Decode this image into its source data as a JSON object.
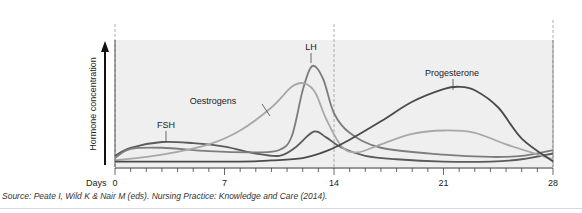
{
  "chart_data": {
    "type": "line",
    "title": "",
    "xlabel": "Days",
    "ylabel": "Hormone concentration",
    "xlim": [
      0,
      28
    ],
    "ylim": [
      0,
      10
    ],
    "x_ticks": [
      0,
      7,
      14,
      21,
      28
    ],
    "minor_tick_step": 1,
    "grid": false,
    "reference_lines": [
      {
        "x": 0,
        "style": "dashed"
      },
      {
        "x": 14,
        "style": "dashed"
      },
      {
        "x": 28,
        "style": "dashed"
      }
    ],
    "background": "#efefef",
    "series": [
      {
        "name": "FSH",
        "color": "#5a5a5a",
        "label_pos": {
          "day": 3.3,
          "value": 4.1
        },
        "x": [
          0,
          1,
          3,
          5,
          7,
          9,
          10.5,
          11.5,
          12.7,
          13.5,
          14.5,
          16,
          18,
          21,
          24,
          26,
          28
        ],
        "values": [
          0.8,
          1.5,
          2.0,
          1.9,
          1.6,
          1.0,
          0.8,
          1.5,
          2.9,
          2.4,
          1.5,
          0.8,
          0.5,
          0.3,
          0.3,
          0.5,
          1.0
        ]
      },
      {
        "name": "LH",
        "color": "#7d7d7d",
        "label_pos": {
          "day": 12.6,
          "value": 9.6
        },
        "x": [
          0,
          1,
          3,
          6,
          9,
          10.5,
          11.3,
          12,
          12.6,
          13.3,
          14,
          15,
          17,
          21,
          24,
          26,
          28
        ],
        "values": [
          0.6,
          1.4,
          1.5,
          1.2,
          1.1,
          1.3,
          2.5,
          6.5,
          8.6,
          7.5,
          4.5,
          2.8,
          1.5,
          0.9,
          0.7,
          0.8,
          1.3
        ]
      },
      {
        "name": "Oestrogens",
        "color": "#a8a8a8",
        "label_pos": {
          "day": 6,
          "value": 6.3
        },
        "x": [
          0,
          3,
          6,
          8,
          10,
          11.3,
          12.1,
          12.8,
          13.5,
          14.5,
          15.5,
          17,
          19,
          21,
          23,
          25,
          28
        ],
        "values": [
          0.4,
          0.9,
          1.8,
          3.0,
          5.0,
          6.8,
          7.1,
          6.3,
          4.0,
          1.6,
          1.1,
          1.8,
          2.7,
          3.0,
          2.8,
          1.8,
          0.5
        ]
      },
      {
        "name": "Progesterone",
        "color": "#4a4a4a",
        "label_pos": {
          "day": 22.5,
          "value": 8.2
        },
        "x": [
          0,
          4,
          8,
          10,
          12,
          13.5,
          15,
          17,
          19,
          21,
          22,
          23,
          24.5,
          26,
          28
        ],
        "values": [
          0.3,
          0.3,
          0.3,
          0.4,
          0.6,
          1.2,
          2.2,
          3.8,
          5.5,
          6.6,
          6.8,
          6.5,
          5.0,
          2.3,
          0.3
        ]
      }
    ],
    "annotations": [
      "FSH",
      "Oestrogens",
      "LH",
      "Progesterone"
    ]
  },
  "footnote": "Source: Peate I, Wild K & Nair M (eds). Nursing Practice: Knowledge and Care (2014).",
  "colors": {
    "plot_bg": "#efefef",
    "axis": "#333333",
    "dashed": "#9a9a9a",
    "text": "#222222"
  }
}
